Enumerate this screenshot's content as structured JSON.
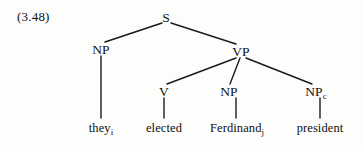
{
  "figure": {
    "example_number": "(3.48)",
    "kind": "syntax-tree",
    "background_color": "#fdfdfc",
    "line_color": "#1a1a1a"
  },
  "tree": {
    "root": {
      "label": "S",
      "x": 166,
      "y": 17
    },
    "level2": [
      {
        "id": "np-subject",
        "label": "NP",
        "x": 101,
        "y": 49
      },
      {
        "id": "vp",
        "label": "VP",
        "x": 241,
        "y": 51
      }
    ],
    "level3": [
      {
        "id": "v",
        "label": "V",
        "x": 164,
        "y": 91
      },
      {
        "id": "np-object",
        "label": "NP",
        "x": 229,
        "y": 91
      },
      {
        "id": "np-complement",
        "label": "NP",
        "subscript": "c",
        "x": 316,
        "y": 91
      }
    ],
    "leaves": [
      {
        "id": "leaf-they",
        "text": "they",
        "subscript": "i",
        "x": 101,
        "y": 128
      },
      {
        "id": "leaf-elected",
        "text": "elected",
        "subscript": "",
        "x": 164,
        "y": 128
      },
      {
        "id": "leaf-ferdinand",
        "text": "Ferdinand",
        "subscript": "j",
        "x": 237,
        "y": 128
      },
      {
        "id": "leaf-president",
        "text": "president",
        "subscript": "",
        "x": 320,
        "y": 128
      }
    ],
    "edges": [
      {
        "id": "edge-s-np",
        "from": "S",
        "to": "NP",
        "x1": 162,
        "y1": 23,
        "x2": 105,
        "y2": 42
      },
      {
        "id": "edge-s-vp",
        "from": "S",
        "to": "VP",
        "x1": 171,
        "y1": 23,
        "x2": 236,
        "y2": 44
      },
      {
        "id": "edge-np-they",
        "from": "NP",
        "to": "they",
        "x1": 101,
        "y1": 55,
        "x2": 101,
        "y2": 118
      },
      {
        "id": "edge-vp-v",
        "from": "VP",
        "to": "V",
        "x1": 236,
        "y1": 57,
        "x2": 167,
        "y2": 84
      },
      {
        "id": "edge-vp-np",
        "from": "VP",
        "to": "NP",
        "x1": 240,
        "y1": 57,
        "x2": 230,
        "y2": 84
      },
      {
        "id": "edge-vp-npc",
        "from": "VP",
        "to": "NPc",
        "x1": 246,
        "y1": 57,
        "x2": 312,
        "y2": 84
      },
      {
        "id": "edge-v-elected",
        "from": "V",
        "to": "elected",
        "x1": 164,
        "y1": 97,
        "x2": 164,
        "y2": 118
      },
      {
        "id": "edge-np-ferdinand",
        "from": "NP",
        "to": "Ferdinand",
        "x1": 236,
        "y1": 97,
        "x2": 236,
        "y2": 118
      },
      {
        "id": "edge-npc-president",
        "from": "NPc",
        "to": "president",
        "x1": 320,
        "y1": 97,
        "x2": 320,
        "y2": 118
      }
    ]
  }
}
